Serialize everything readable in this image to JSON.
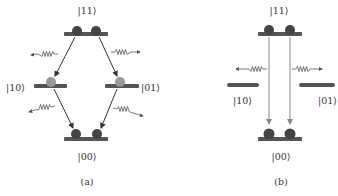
{
  "diagram": {
    "panel_a": {
      "caption": "(a)",
      "states": {
        "top": "|11⟩",
        "left": "|10⟩",
        "right": "|01⟩",
        "bottom": "|00⟩"
      },
      "description": "Cascade decay |11⟩ → |10⟩,|01⟩ → |00⟩ with photon emission at each step"
    },
    "panel_b": {
      "caption": "(b)",
      "states": {
        "top": "|11⟩",
        "left": "|10⟩",
        "right": "|01⟩",
        "bottom": "|00⟩"
      },
      "description": "Direct transition |11⟩ → |00⟩ with two photons emitted"
    },
    "colors": {
      "level_line": "#555555",
      "particle_dark": "#444444",
      "particle_light": "#999999",
      "arrow_a": "#333333",
      "arrow_b": "#888888",
      "photon": "#555555",
      "text": "#333333"
    }
  }
}
